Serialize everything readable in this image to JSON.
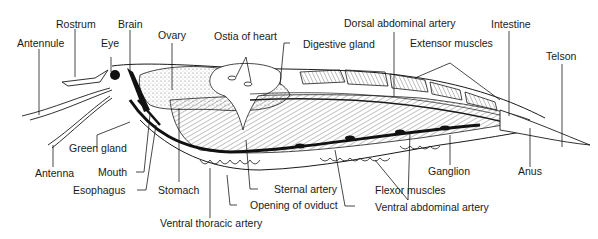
{
  "figure": {
    "colors": {
      "ink": "#1a1a1a",
      "background": "#ffffff",
      "stipple": "#bdbdbd"
    }
  },
  "labels": {
    "rostrum": "Rostrum",
    "brain": "Brain",
    "antennule": "Antennule",
    "eye": "Eye",
    "ovary": "Ovary",
    "ostia_of_heart": "Ostia of heart",
    "digestive_gland": "Digestive gland",
    "dorsal_abdominal_artery": "Dorsal abdominal artery",
    "extensor_muscles": "Extensor muscles",
    "intestine": "Intestine",
    "telson": "Telson",
    "green_gland": "Green gland",
    "antenna": "Antenna",
    "mouth": "Mouth",
    "esophagus": "Esophagus",
    "stomach": "Stomach",
    "sternal_artery": "Sternal artery",
    "opening_of_oviduct": "Opening of oviduct",
    "ventral_thoracic_artery": "Ventral thoracic artery",
    "flexor_muscles": "Flexor muscles",
    "ventral_abdominal_artery": "Ventral abdominal artery",
    "ganglion": "Ganglion",
    "anus": "Anus"
  }
}
